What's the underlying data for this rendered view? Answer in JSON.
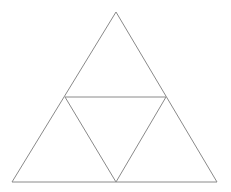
{
  "diagram": {
    "type": "subdivided-triangle",
    "stroke_color": "#8a8a8a",
    "background": "#ffffff",
    "vertices": {
      "top": [
        116,
        12
      ],
      "bottom_left": [
        12,
        182
      ],
      "bottom_right": [
        217,
        182
      ]
    },
    "midpoints": {
      "left": [
        65,
        97
      ],
      "right": [
        166,
        97
      ],
      "bottom": [
        116,
        182
      ]
    }
  }
}
